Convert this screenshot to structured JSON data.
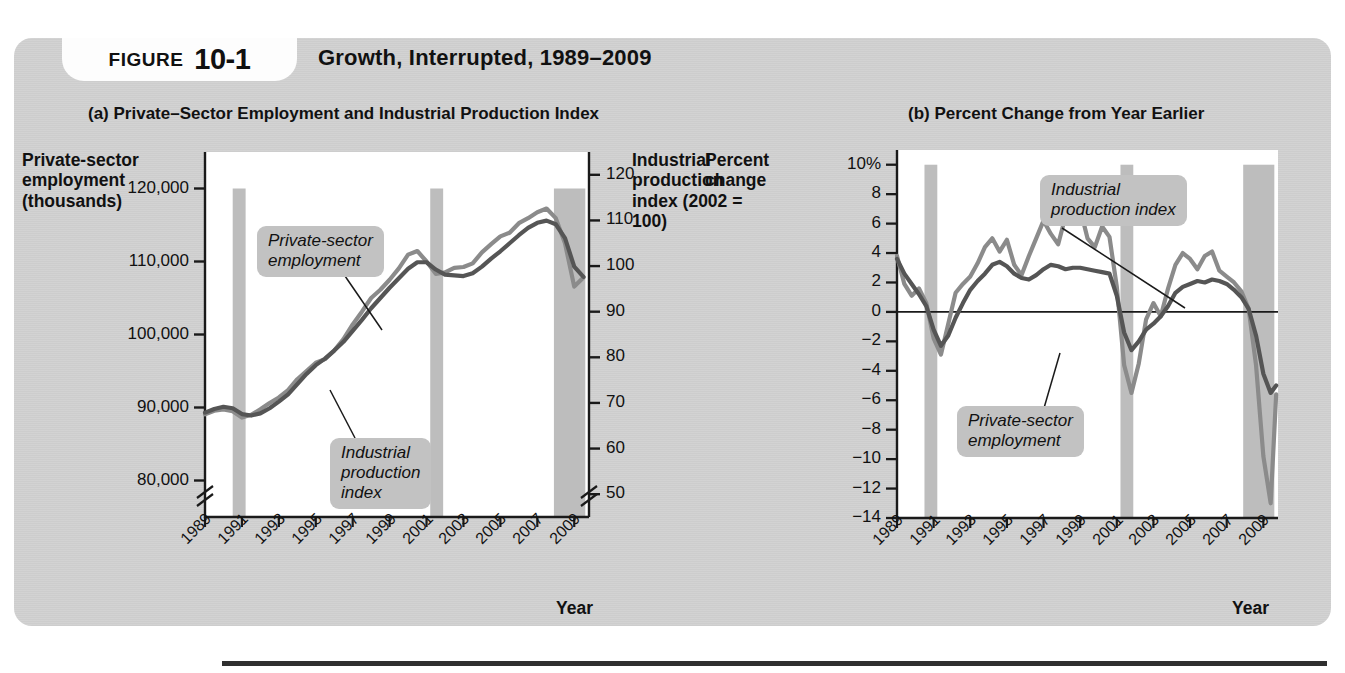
{
  "figure": {
    "label": "FIGURE",
    "number": "10-1",
    "title": "Growth, Interrupted, 1989–2009"
  },
  "panel_a": {
    "title": "(a) Private–Sector Employment and Industrial Production Index",
    "left_axis_title": "Private-sector employment (thousands)",
    "right_axis_title": "Industrial production index (2002 = 100)",
    "x_axis_title": "Year",
    "left_ticks": [
      "120,000",
      "110,000",
      "100,000",
      "90,000",
      "80,000"
    ],
    "right_ticks": [
      "120",
      "110",
      "100",
      "90",
      "80",
      "70",
      "60",
      "50"
    ],
    "x_ticks": [
      "1989",
      "1991",
      "1993",
      "1995",
      "1997",
      "1999",
      "2001",
      "2003",
      "2005",
      "2007",
      "2009"
    ],
    "callout_employment": "Private-sector\nemployment",
    "callout_ipi": "Industrial\nproduction\nindex"
  },
  "panel_b": {
    "title": "(b) Percent Change from Year Earlier",
    "left_axis_title": "Percent change",
    "x_axis_title": "Year",
    "left_ticks": [
      "10%",
      "8",
      "6",
      "4",
      "2",
      "0",
      "−2",
      "−4",
      "−6",
      "−8",
      "−10",
      "−12",
      "−14"
    ],
    "x_ticks": [
      "1989",
      "1991",
      "1993",
      "1995",
      "1997",
      "1999",
      "2001",
      "2003",
      "2005",
      "2007",
      "2009"
    ],
    "callout_ipi": "Industrial\nproduction index",
    "callout_employment": "Private-sector\nemployment"
  },
  "colors": {
    "panel_background": "#d2d2d2",
    "plot_background": "#ffffff",
    "employment_line": "#555555",
    "ipi_line": "#8b8b8b",
    "recession_band": "#bdbdbd",
    "axis": "#1a1a1a",
    "callout_background": "#c2c2c2"
  },
  "chart_data": [
    {
      "type": "line",
      "title": "(a) Private–Sector Employment and Industrial Production Index",
      "xlabel": "Year",
      "ylabel": "Private-sector employment (thousands)",
      "y2label": "Industrial production index (2002 = 100)",
      "xlim": [
        1989,
        2009.8
      ],
      "ylim": [
        75000,
        125000
      ],
      "y2lim": [
        45,
        125
      ],
      "ytick_values": [
        120000,
        110000,
        100000,
        90000,
        80000
      ],
      "y2tick_values": [
        120,
        110,
        100,
        90,
        80,
        70,
        60,
        50
      ],
      "xtick_values": [
        1989,
        1991,
        1993,
        1995,
        1997,
        1999,
        2001,
        2003,
        2005,
        2007,
        2009
      ],
      "axis_break": true,
      "grid": false,
      "legend": "annotated-callouts",
      "recession_bands": [
        [
          1990.5,
          1991.2
        ],
        [
          2001.2,
          2001.9
        ],
        [
          2007.9,
          2009.6
        ]
      ],
      "series": [
        {
          "name": "Private-sector employment",
          "axis": "left",
          "color": "#555555",
          "x": [
            1989.0,
            1989.5,
            1990.0,
            1990.5,
            1991.0,
            1991.5,
            1992.0,
            1992.5,
            1993.0,
            1993.5,
            1994.0,
            1994.5,
            1995.0,
            1995.5,
            1996.0,
            1996.5,
            1997.0,
            1997.5,
            1998.0,
            1998.5,
            1999.0,
            1999.5,
            2000.0,
            2000.5,
            2001.0,
            2001.5,
            2002.0,
            2002.5,
            2003.0,
            2003.5,
            2004.0,
            2004.5,
            2005.0,
            2005.5,
            2006.0,
            2006.5,
            2007.0,
            2007.5,
            2008.0,
            2008.5,
            2009.0,
            2009.5
          ],
          "values": [
            89300,
            89800,
            90100,
            89900,
            89100,
            88900,
            89200,
            89900,
            90800,
            91800,
            93200,
            94600,
            95800,
            96700,
            97800,
            99000,
            100500,
            102000,
            103600,
            105000,
            106400,
            107700,
            109000,
            109900,
            109900,
            108900,
            108200,
            108100,
            108000,
            108400,
            109300,
            110400,
            111400,
            112500,
            113600,
            114600,
            115300,
            115600,
            115100,
            113200,
            109300,
            107900
          ]
        },
        {
          "name": "Industrial production index",
          "axis": "right",
          "color": "#8b8b8b",
          "x": [
            1989.0,
            1989.5,
            1990.0,
            1990.5,
            1991.0,
            1991.5,
            1992.0,
            1992.5,
            1993.0,
            1993.5,
            1994.0,
            1994.5,
            1995.0,
            1995.5,
            1996.0,
            1996.5,
            1997.0,
            1997.5,
            1998.0,
            1998.5,
            1999.0,
            1999.5,
            2000.0,
            2000.5,
            2001.0,
            2001.5,
            2002.0,
            2002.5,
            2003.0,
            2003.5,
            2004.0,
            2004.5,
            2005.0,
            2005.5,
            2006.0,
            2006.5,
            2007.0,
            2007.5,
            2008.0,
            2008.5,
            2009.0,
            2009.5
          ],
          "values": [
            67.5,
            68.3,
            68.6,
            68.2,
            66.8,
            67.4,
            68.6,
            70.0,
            71.2,
            72.8,
            75.2,
            77.0,
            78.8,
            79.6,
            81.5,
            84.0,
            87.2,
            90.0,
            93.0,
            94.8,
            97.0,
            99.5,
            102.5,
            103.3,
            101.0,
            98.3,
            98.6,
            99.6,
            99.8,
            100.6,
            103.0,
            104.8,
            106.5,
            107.3,
            109.4,
            110.5,
            111.8,
            112.6,
            110.5,
            105.0,
            95.5,
            97.5
          ]
        }
      ]
    },
    {
      "type": "line",
      "title": "(b) Percent Change from Year Earlier",
      "xlabel": "Year",
      "ylabel": "Percent change",
      "xlim": [
        1989,
        2009.8
      ],
      "ylim": [
        -14,
        11
      ],
      "ytick_values": [
        10,
        8,
        6,
        4,
        2,
        0,
        -2,
        -4,
        -6,
        -8,
        -10,
        -12,
        -14
      ],
      "xtick_values": [
        1989,
        1991,
        1993,
        1995,
        1997,
        1999,
        2001,
        2003,
        2005,
        2007,
        2009
      ],
      "grid": false,
      "zero_line": true,
      "legend": "annotated-callouts",
      "recession_bands": [
        [
          1990.5,
          1991.2
        ],
        [
          2001.2,
          2001.9
        ],
        [
          2007.9,
          2009.6
        ]
      ],
      "series": [
        {
          "name": "Private-sector employment",
          "color": "#555555",
          "x": [
            1989.0,
            1989.4,
            1989.8,
            1990.2,
            1990.6,
            1991.0,
            1991.4,
            1991.8,
            1992.2,
            1992.6,
            1993.0,
            1993.4,
            1993.8,
            1994.2,
            1994.6,
            1995.0,
            1995.4,
            1995.8,
            1996.2,
            1996.6,
            1997.0,
            1997.4,
            1997.8,
            1998.2,
            1998.6,
            1999.0,
            1999.4,
            1999.8,
            2000.2,
            2000.6,
            2001.0,
            2001.4,
            2001.8,
            2002.2,
            2002.6,
            2003.0,
            2003.4,
            2003.8,
            2004.2,
            2004.6,
            2005.0,
            2005.4,
            2005.8,
            2006.2,
            2006.6,
            2007.0,
            2007.4,
            2007.8,
            2008.2,
            2008.6,
            2009.0,
            2009.4,
            2009.7
          ],
          "values": [
            3.6,
            2.6,
            1.9,
            1.2,
            0.4,
            -1.2,
            -2.3,
            -1.6,
            -0.4,
            0.6,
            1.5,
            2.1,
            2.6,
            3.2,
            3.4,
            3.1,
            2.6,
            2.3,
            2.2,
            2.5,
            2.9,
            3.2,
            3.1,
            2.9,
            3.0,
            3.0,
            2.9,
            2.8,
            2.7,
            2.6,
            1.1,
            -1.4,
            -2.6,
            -2.0,
            -1.2,
            -0.8,
            -0.3,
            0.4,
            1.3,
            1.7,
            1.9,
            2.1,
            2.0,
            2.2,
            2.1,
            1.9,
            1.5,
            1.0,
            0.2,
            -1.6,
            -4.2,
            -5.5,
            -5.0
          ]
        },
        {
          "name": "Industrial production index",
          "color": "#8b8b8b",
          "x": [
            1989.0,
            1989.4,
            1989.8,
            1990.2,
            1990.6,
            1991.0,
            1991.4,
            1991.8,
            1992.2,
            1992.6,
            1993.0,
            1993.4,
            1993.8,
            1994.2,
            1994.6,
            1995.0,
            1995.4,
            1995.8,
            1996.2,
            1996.6,
            1997.0,
            1997.4,
            1997.8,
            1998.2,
            1998.6,
            1999.0,
            1999.4,
            1999.8,
            2000.2,
            2000.6,
            2001.0,
            2001.4,
            2001.8,
            2002.2,
            2002.6,
            2003.0,
            2003.4,
            2003.8,
            2004.2,
            2004.6,
            2005.0,
            2005.4,
            2005.8,
            2006.2,
            2006.6,
            2007.0,
            2007.4,
            2007.8,
            2008.2,
            2008.6,
            2009.0,
            2009.4,
            2009.7
          ],
          "values": [
            3.8,
            1.9,
            1.1,
            1.6,
            0.6,
            -1.8,
            -2.9,
            -0.8,
            1.3,
            1.9,
            2.4,
            3.3,
            4.4,
            5.0,
            4.1,
            4.9,
            3.2,
            2.5,
            3.8,
            5.0,
            6.2,
            5.3,
            4.6,
            6.5,
            8.8,
            7.0,
            5.0,
            4.4,
            5.8,
            5.1,
            1.7,
            -3.6,
            -5.5,
            -3.5,
            -0.5,
            0.6,
            -0.3,
            1.6,
            3.2,
            4.0,
            3.6,
            2.9,
            3.8,
            4.1,
            2.8,
            2.4,
            2.0,
            1.4,
            0.2,
            -3.6,
            -9.8,
            -13.0,
            -5.6
          ]
        }
      ]
    }
  ]
}
